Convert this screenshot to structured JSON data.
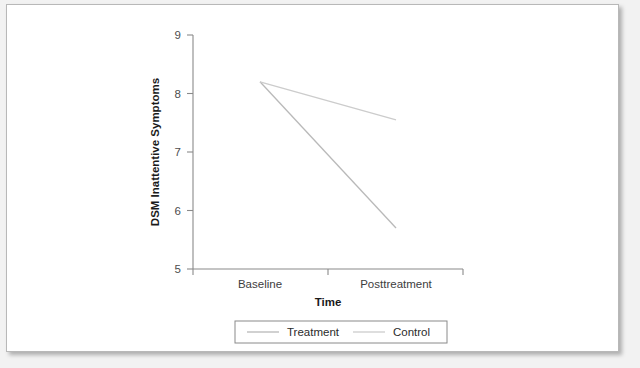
{
  "figure": {
    "background_color": "#ffffff",
    "page_background_color": "#f2f2f2",
    "border_color": "#b8b8b8"
  },
  "chart_data": {
    "type": "line",
    "title": "",
    "subtitle": "",
    "xlabel": "Time",
    "ylabel": "DSM Inattentive Symptoms",
    "categories": [
      "Baseline",
      "Posttreatment"
    ],
    "ylim": [
      5,
      9
    ],
    "yticks": [
      5,
      6,
      7,
      8,
      9
    ],
    "ytick_labels": [
      "5",
      "6",
      "7",
      "8",
      "9"
    ],
    "grid": false,
    "legend_position": "bottom",
    "series": [
      {
        "name": "Treatment",
        "color": "#b9b9b9",
        "values": [
          8.2,
          5.7
        ]
      },
      {
        "name": "Control",
        "color": "#cccccc",
        "values": [
          8.2,
          7.55
        ]
      }
    ]
  },
  "axes": {
    "y_tick_0": "5",
    "y_tick_1": "6",
    "y_tick_2": "7",
    "y_tick_3": "8",
    "y_tick_4": "9",
    "x_cat_0": "Baseline",
    "x_cat_1": "Posttreatment",
    "x_title": "Time",
    "y_title": "DSM Inattentive Symptoms"
  },
  "legend": {
    "entries": [
      {
        "label": "Treatment",
        "color": "#b9b9b9"
      },
      {
        "label": "Control",
        "color": "#cccccc"
      }
    ]
  }
}
